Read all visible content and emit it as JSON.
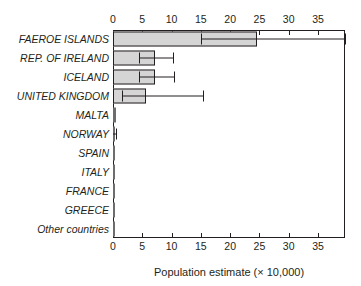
{
  "chart_data": {
    "type": "bar",
    "orientation": "horizontal",
    "title": "",
    "xlabel": "Population estimate (× 10,000)",
    "ylabel": "",
    "xlim": [
      0,
      39.6
    ],
    "xticks": [
      0,
      5,
      10,
      15,
      20,
      25,
      30,
      35
    ],
    "xtick_labels": [
      "0",
      "5",
      "10",
      "15",
      "20",
      "25",
      "30",
      "35"
    ],
    "grid": false,
    "legend": null,
    "axis_top": true,
    "axis_bottom": true,
    "bar_fill": "#d5d5d5",
    "bar_edge": "#231f20",
    "categories": [
      "FAEROE ISLANDS",
      "REP. OF IRELAND",
      "ICELAND",
      "UNITED KINGDOM",
      "MALTA",
      "NORWAY",
      "SPAIN",
      "ITALY",
      "FRANCE",
      "GREECE",
      "Other countries"
    ],
    "values": [
      24.5,
      7.2,
      7.2,
      5.6,
      0.45,
      0.2,
      0.2,
      0.2,
      0.15,
      0.1,
      0.1
    ],
    "errors_low": [
      15.0,
      4.5,
      4.5,
      1.5,
      0.0,
      0.0,
      0.0,
      0.0,
      0.0,
      0.0,
      0.0
    ],
    "errors_high": [
      39.6,
      10.2,
      10.4,
      15.3,
      0.0,
      0.55,
      0.0,
      0.0,
      0.0,
      0.0,
      0.0
    ],
    "has_error_bar": [
      true,
      true,
      true,
      true,
      false,
      true,
      false,
      false,
      false,
      false,
      false
    ]
  }
}
